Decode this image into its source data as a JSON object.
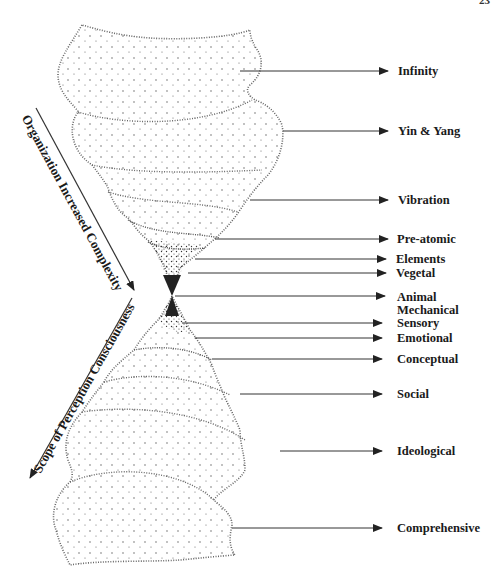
{
  "page": {
    "number": "23"
  },
  "diagram": {
    "title": "",
    "levels": [
      {
        "label": "Infinity",
        "y": 71
      },
      {
        "label": "Yin & Yang",
        "y": 131
      },
      {
        "label": "Vibration",
        "y": 200
      },
      {
        "label": "Pre-atomic",
        "y": 239
      },
      {
        "label": "Elements",
        "y": 259
      },
      {
        "label": "Vegetal",
        "y": 273
      },
      {
        "label": "Animal",
        "y": 296
      },
      {
        "label": "Mechanical",
        "y": 310
      },
      {
        "label": "Sensory",
        "y": 323
      },
      {
        "label": "Emotional",
        "y": 338
      },
      {
        "label": "Conceptual",
        "y": 359
      },
      {
        "label": "Social",
        "y": 394
      },
      {
        "label": "Ideological",
        "y": 451
      },
      {
        "label": "Comprehensive",
        "y": 528
      }
    ],
    "axes": {
      "upper": "Organization Increased Complexity",
      "lower": "Scope of Perception Consciousness"
    }
  }
}
